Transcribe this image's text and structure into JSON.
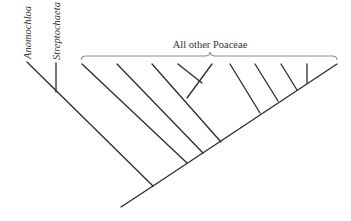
{
  "diagram": {
    "type": "phylogenetic-tree",
    "labels": {
      "taxon_1": "Anomochloa",
      "taxon_2": "Streptochaeta",
      "clade": "All other Poaceae"
    },
    "colors": {
      "branch": "#2b2b2b",
      "bracket": "#8a8a8a",
      "text": "#333333"
    },
    "clade_bracket": {
      "x1": 81,
      "x2": 337,
      "y": 56,
      "tick_x": 210
    },
    "branches": [
      {
        "x1": 121,
        "y1": 207,
        "x2": 153,
        "y2": 186
      },
      {
        "x1": 153,
        "y1": 186,
        "x2": 27,
        "y2": 62
      },
      {
        "x1": 56,
        "y1": 92,
        "x2": 56,
        "y2": 63
      },
      {
        "x1": 153,
        "y1": 186,
        "x2": 337,
        "y2": 64
      },
      {
        "x1": 187,
        "y1": 163,
        "x2": 82,
        "y2": 64
      },
      {
        "x1": 203,
        "y1": 153,
        "x2": 117,
        "y2": 64
      },
      {
        "x1": 221,
        "y1": 142,
        "x2": 152,
        "y2": 64
      },
      {
        "x1": 187,
        "y1": 98,
        "x2": 212,
        "y2": 64
      },
      {
        "x1": 202,
        "y1": 83,
        "x2": 178,
        "y2": 64
      },
      {
        "x1": 260,
        "y1": 113,
        "x2": 230,
        "y2": 64
      },
      {
        "x1": 278,
        "y1": 101,
        "x2": 255,
        "y2": 64
      },
      {
        "x1": 297,
        "y1": 90,
        "x2": 281,
        "y2": 64
      },
      {
        "x1": 307,
        "y1": 83,
        "x2": 307,
        "y2": 64
      }
    ]
  }
}
